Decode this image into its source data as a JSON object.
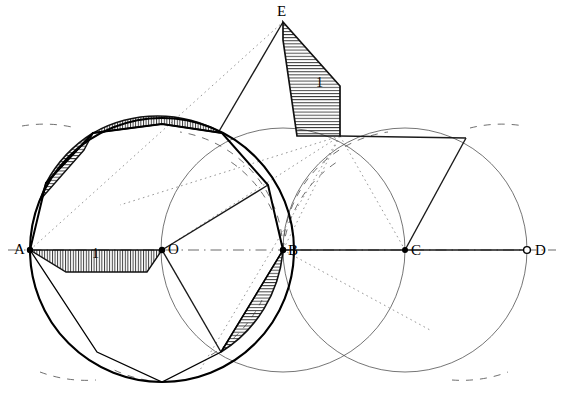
{
  "figure": {
    "background": "#ffffff",
    "ink": "#000000",
    "width": 564,
    "height": 400
  },
  "points": [
    {
      "id": "A",
      "label": "A",
      "x": 30,
      "y": 250,
      "marker": "dot",
      "label_x": 14,
      "label_y": 242
    },
    {
      "id": "O",
      "label": "O",
      "x": 162,
      "y": 250,
      "marker": "dot",
      "label_x": 168,
      "label_y": 242
    },
    {
      "id": "B",
      "label": "B",
      "x": 283,
      "y": 250,
      "marker": "dot",
      "label_x": 288,
      "label_y": 243
    },
    {
      "id": "C",
      "label": "C",
      "x": 405,
      "y": 250,
      "marker": "dot",
      "label_x": 411,
      "label_y": 243
    },
    {
      "id": "D",
      "label": "D",
      "x": 527,
      "y": 250,
      "marker": "ring",
      "label_x": 535,
      "label_y": 243
    },
    {
      "id": "E",
      "label": "E",
      "x": 283,
      "y": 22,
      "marker": "none",
      "label_x": 277,
      "label_y": 4
    }
  ],
  "measure_labels": [
    {
      "id": "unit-base",
      "text": "1",
      "x": 92,
      "y": 247
    },
    {
      "id": "unit-slant",
      "text": "1",
      "x": 316,
      "y": 76
    }
  ],
  "circles": [
    {
      "id": "main-circle",
      "cx": 162,
      "cy": 250,
      "r": 132,
      "weight": "bold",
      "style": "solid"
    },
    {
      "id": "circle-at-O",
      "cx": 162,
      "cy": 250,
      "r": 132,
      "weight": "light",
      "style": "solid"
    },
    {
      "id": "circle-at-B",
      "cx": 283,
      "cy": 250,
      "r": 122,
      "weight": "light",
      "style": "solid"
    },
    {
      "id": "circle-at-C",
      "cx": 405,
      "cy": 250,
      "r": 122,
      "weight": "light",
      "style": "solid"
    }
  ],
  "axis": {
    "id": "baseline-AD",
    "from": "A",
    "to": "D",
    "style": "dash-dot"
  },
  "polygon": {
    "id": "inscribed-polygon",
    "note": "bold inscribed/circumscribed polygon around circle O",
    "vertices": [
      [
        30,
        250
      ],
      [
        46,
        183
      ],
      [
        93,
        133
      ],
      [
        162,
        124
      ],
      [
        222,
        133
      ],
      [
        268,
        185
      ],
      [
        283,
        250
      ],
      [
        221,
        352
      ],
      [
        162,
        382
      ],
      [
        97,
        352
      ]
    ]
  },
  "hatched_bands": [
    {
      "id": "band-base-AO",
      "label": "1",
      "hatch": "vertical"
    },
    {
      "id": "band-upper-left",
      "label": "",
      "hatch": "horizontal"
    },
    {
      "id": "band-top",
      "label": "",
      "hatch": "vertical"
    },
    {
      "id": "band-lens-B",
      "label": "",
      "hatch": "horizontal"
    },
    {
      "id": "band-slant-E",
      "label": "1",
      "hatch": "horizontal"
    }
  ],
  "construction": {
    "dotted_rays_from_E": true,
    "dashed_arcs": true,
    "solid_chords": true
  }
}
